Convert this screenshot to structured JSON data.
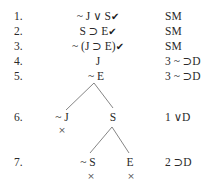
{
  "lines": [
    {
      "num": "1.",
      "formula": "~ J ∨ S",
      "checked": true,
      "justification": "SM"
    },
    {
      "num": "2.",
      "formula": "S ⊃ E",
      "checked": true,
      "justification": "SM"
    },
    {
      "num": "3.",
      "formula": "~ (J ⊃ E)",
      "checked": true,
      "justification": "SM"
    },
    {
      "num": "4.",
      "formula": "J",
      "checked": false,
      "justification": "3 ~ ⊃D"
    },
    {
      "num": "5.",
      "formula": "~ E",
      "checked": false,
      "justification": "3 ~ ⊃D"
    },
    {
      "num": "6.",
      "branches": [
        "~ J",
        "S"
      ],
      "justification": "1 ∨D"
    },
    {
      "num": "7.",
      "branches": [
        "~ S",
        "E"
      ],
      "justification": "2 ⊃D"
    }
  ],
  "check_mark": "✔",
  "closed_mark": "×",
  "closed_branches": [
    "~ J",
    "~ S",
    "E"
  ]
}
